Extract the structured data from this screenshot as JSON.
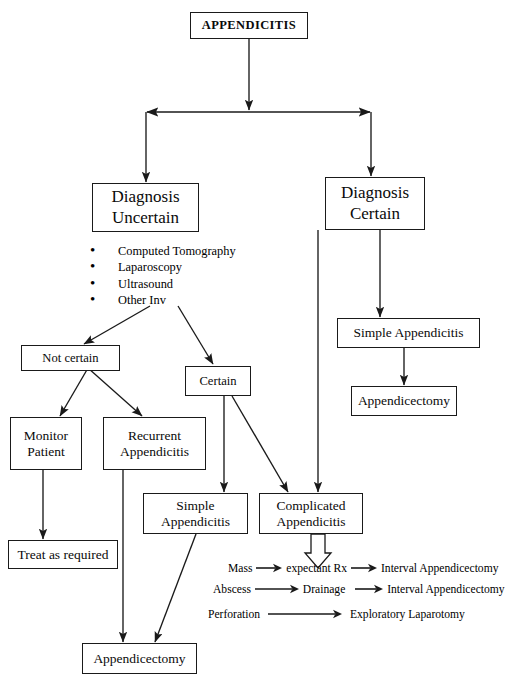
{
  "diagram": {
    "root": {
      "label": "APPENDICITIS"
    },
    "branches": {
      "uncertain": {
        "line1": "Diagnosis",
        "line2": "Uncertain"
      },
      "certain": {
        "line1": "Diagnosis",
        "line2": "Certain"
      }
    },
    "investigations": [
      "Computed Tomography",
      "Laparoscopy",
      "Ultrasound",
      "Other Inv"
    ],
    "nodes": {
      "not_certain": {
        "line1": "Not certain"
      },
      "certain_small": {
        "line1": "Certain"
      },
      "monitor_patient": {
        "line1": "Monitor",
        "line2": "Patient"
      },
      "recurrent_appendicitis": {
        "line1": "Recurrent",
        "line2": "Appendicitis"
      },
      "simple_appendicitis_left": {
        "line1": "Simple",
        "line2": "Appendicitis"
      },
      "complicated_appendicitis": {
        "line1": "Complicated",
        "line2": "Appendicitis"
      },
      "treat_as_required": {
        "line1": "Treat as required"
      },
      "appendicectomy_bottom": {
        "line1": "Appendicectomy"
      },
      "simple_appendicitis_right": {
        "line1": "Simple Appendicitis"
      },
      "appendicectomy_right": {
        "line1": "Appendicectomy"
      }
    },
    "complicated_pathways": [
      {
        "condition": "Mass",
        "treatment": "expectant Rx",
        "followup": "Interval Appendicectomy"
      },
      {
        "condition": "Abscess",
        "treatment": "Drainage",
        "followup": "Interval Appendicectomy"
      },
      {
        "condition": "Perforation",
        "treatment": "Exploratory Laparotomy",
        "followup": ""
      }
    ],
    "colors": {
      "stroke": "#1a1a1a",
      "text": "#0a0a0a",
      "background": "#ffffff"
    }
  }
}
